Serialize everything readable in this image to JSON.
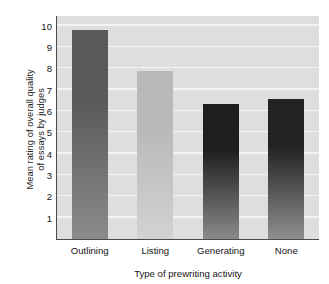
{
  "chart_data": {
    "type": "bar",
    "title": "",
    "categories": [
      "Outlining",
      "Listing",
      "Generating",
      "None"
    ],
    "values": [
      9.8,
      7.85,
      6.35,
      6.55
    ],
    "series": [
      {
        "name": "Mean rating of overall quality of essays by judges",
        "values": [
          9.8,
          7.85,
          6.35,
          6.55
        ]
      }
    ],
    "xlabel": "Type of prewriting activity",
    "ylabel": "Mean rating of overall quality\nof essays by judges",
    "ylim": [
      0,
      10.45
    ],
    "yticks": [
      1,
      2,
      3,
      4,
      5,
      6,
      7,
      8,
      9,
      10
    ],
    "ytick_labels": [
      "1",
      "2",
      "3",
      "4",
      "5",
      "6",
      "7",
      "8",
      "9",
      "10"
    ],
    "grid": "horizontal",
    "legend": "none",
    "bar_colors": [
      "#5a5a5a",
      "#b9b9b7",
      "#1e1e1e",
      "#232323"
    ],
    "bar_colors_bottom": [
      "#8b8b8b",
      "#d2d2d0",
      "#8a8a8a",
      "#8f8f8f"
    ],
    "plot_background": "#dededc",
    "gridline_color": "#f4f4f2",
    "axis_color": "#4a4a4a",
    "text_color": "#141414"
  }
}
